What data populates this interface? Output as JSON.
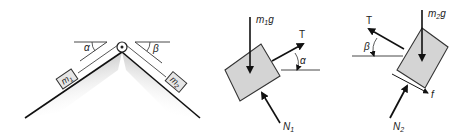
{
  "figure1": {
    "mass1_label": "m",
    "mass1_sub": "1",
    "mass2_label": "m",
    "mass2_sub": "2",
    "angle_left": "α",
    "angle_right": "β"
  },
  "figure2": {
    "weight_label": "m",
    "weight_sub": "1",
    "weight_suffix": "g",
    "tension_label": "T",
    "angle_label": "α",
    "normal_label": "N",
    "normal_sub": "1"
  },
  "figure3": {
    "weight_label": "m",
    "weight_sub": "2",
    "weight_suffix": "g",
    "tension_label": "T",
    "angle_label": "β",
    "normal_label": "N",
    "normal_sub": "2",
    "friction_label": "f"
  },
  "colors": {
    "block_fill": "#d4d4d4",
    "stroke": "#1a1a1a",
    "background": "#ffffff"
  }
}
